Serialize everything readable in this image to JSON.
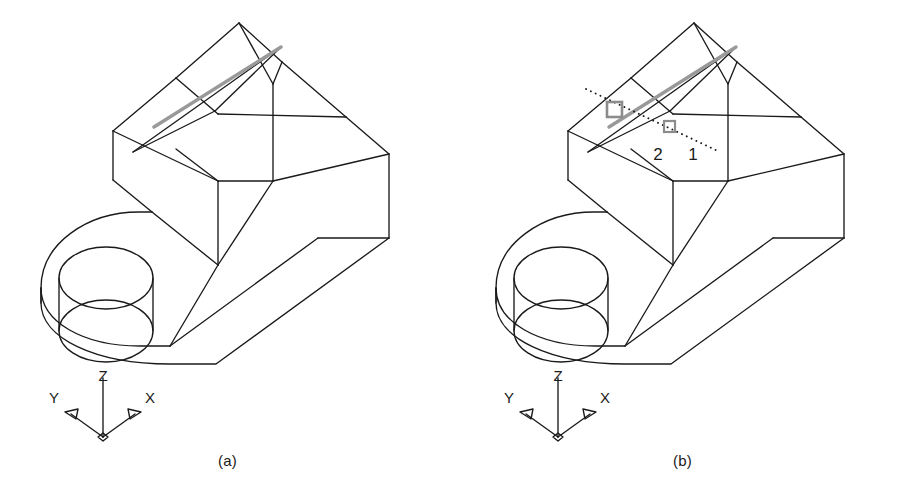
{
  "figure": {
    "type": "cad-isometric-wireframe-pair",
    "background_color": "#ffffff",
    "line_color": "#1a1a1a",
    "highlight_color": "#999999",
    "marker_color": "#8c8c8c",
    "panels": [
      {
        "id": "a",
        "caption": "(a)",
        "ucs": {
          "x_label": "X",
          "y_label": "Y",
          "z_label": "Z"
        },
        "markers": [],
        "has_highlighted_edge": true
      },
      {
        "id": "b",
        "caption": "(b)",
        "ucs": {
          "x_label": "X",
          "y_label": "Y",
          "z_label": "Z"
        },
        "markers": [
          {
            "label": "2",
            "marker_size": "large",
            "shape": "square"
          },
          {
            "label": "1",
            "marker_size": "small",
            "shape": "square"
          }
        ],
        "has_highlighted_edge": true,
        "has_dotted_trace": true
      }
    ]
  },
  "geometry": {
    "body_outline": "M 41,303 L 41,288 C 41,243 88,212 139,212 L 152,212 L 152,180 L 113,180 L 113,131 L 176,78 L 239,23 L 282,62 L 346,117 L 389,154 L 389,238 L 216,364 L 170,364 C 95,364 41,338 41,303 Z",
    "holes": {
      "top_ellipse": {
        "cx": 106,
        "cy": 278,
        "rx": 47,
        "ry": 31
      },
      "bottom_ellipse": {
        "cx": 106,
        "cy": 331,
        "rx": 47,
        "ry": 31
      }
    },
    "highlight_edge": {
      "x1": 154,
      "y1": 127,
      "x2": 281,
      "y2": 47
    },
    "dotted_trace": {
      "x1": 131,
      "y1": 89,
      "x2": 265,
      "y2": 152
    }
  }
}
